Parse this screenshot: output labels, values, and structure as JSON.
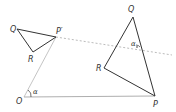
{
  "diagram": {
    "type": "geometry-rotation",
    "labels": {
      "Q_left": "Q",
      "P_prime": "P′",
      "R_left": "R",
      "O": "O",
      "alpha_O": "α",
      "Q_right": "Q",
      "R_right": "R",
      "P": "P",
      "alpha_right": "α"
    },
    "colors": {
      "stroke": "#333333",
      "faint": "#999999",
      "dashed": "#aaaaaa"
    }
  }
}
